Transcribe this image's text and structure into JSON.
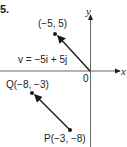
{
  "figure": {
    "number_label": "5.",
    "axes": {
      "x_label": "x",
      "y_label": "y",
      "origin_label": "0"
    },
    "vectors": [
      {
        "name": "v",
        "label": "v = −5i + 5j",
        "from": [
          0,
          0
        ],
        "to": [
          -5,
          5
        ],
        "tip_label": "(−5, 5)"
      },
      {
        "name": "PQ",
        "from": [
          -3,
          -8
        ],
        "to": [
          -8,
          -3
        ],
        "start_label": "P(−3, −8)",
        "end_label": "Q(−8, −3)"
      }
    ],
    "colors": {
      "line": "#1a1a1a",
      "axis": "#555555",
      "text": "#222222"
    }
  }
}
